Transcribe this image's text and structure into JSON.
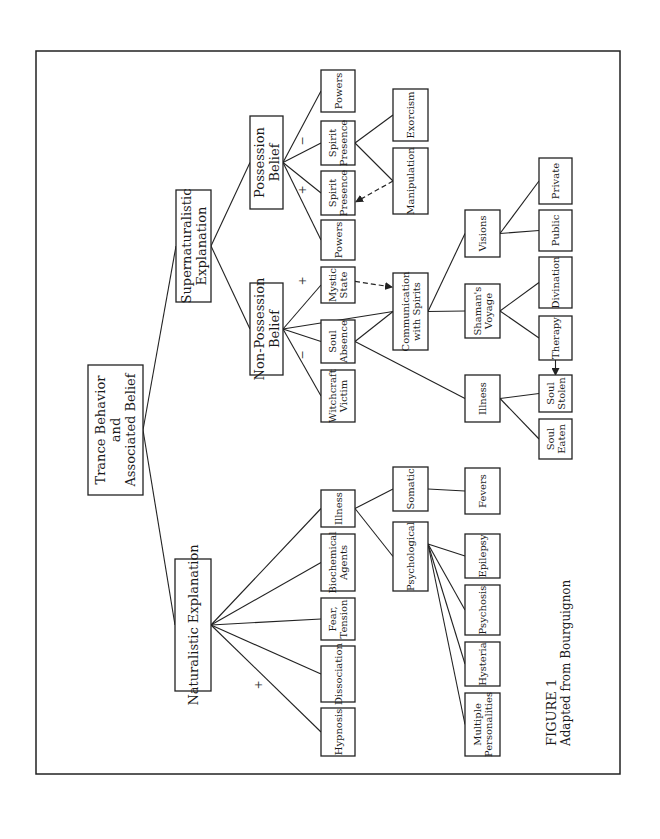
{
  "figure": {
    "caption_title": "FIGURE 1",
    "caption_subtitle": "Adapted from Bourguignon"
  },
  "nodes": {
    "root": {
      "lines": [
        "Trance Behavior",
        "and",
        "Associated Belief"
      ],
      "x": 88,
      "y": 365,
      "w": 55,
      "h": 130,
      "size": "large"
    },
    "supernaturalistic": {
      "lines": [
        "Supernaturalistic",
        "Explanation"
      ],
      "x": 176,
      "y": 190,
      "w": 35,
      "h": 112,
      "size": "large"
    },
    "naturalistic": {
      "lines": [
        "Naturalistic Explanation"
      ],
      "x": 175,
      "y": 559,
      "w": 36,
      "h": 132,
      "size": "large"
    },
    "possession": {
      "lines": [
        "Possession",
        "Belief"
      ],
      "x": 250,
      "y": 116,
      "w": 33,
      "h": 93,
      "size": "large"
    },
    "non_possession": {
      "lines": [
        "Non-Possession",
        "Belief"
      ],
      "x": 250,
      "y": 283,
      "w": 33,
      "h": 92,
      "size": "large"
    },
    "powers_neg": {
      "lines": [
        "Powers"
      ],
      "x": 321,
      "y": 70,
      "w": 34,
      "h": 42
    },
    "spirit_presence_neg": {
      "lines": [
        "Spirit",
        "Presence"
      ],
      "x": 321,
      "y": 121,
      "w": 34,
      "h": 44
    },
    "spirit_presence_pos": {
      "lines": [
        "Spirit",
        "Presence"
      ],
      "x": 321,
      "y": 171,
      "w": 34,
      "h": 44
    },
    "powers_pos": {
      "lines": [
        "Powers"
      ],
      "x": 321,
      "y": 220,
      "w": 34,
      "h": 40
    },
    "mystic_state": {
      "lines": [
        "Mystic",
        "State"
      ],
      "x": 321,
      "y": 267,
      "w": 34,
      "h": 36
    },
    "soul_absence": {
      "lines": [
        "Soul",
        "Absence"
      ],
      "x": 321,
      "y": 320,
      "w": 34,
      "h": 43
    },
    "witchcraft_victim": {
      "lines": [
        "Witchcraft",
        "Victim"
      ],
      "x": 321,
      "y": 370,
      "w": 34,
      "h": 52
    },
    "illness_nat": {
      "lines": [
        "Illness"
      ],
      "x": 321,
      "y": 490,
      "w": 34,
      "h": 37
    },
    "biochemical_agents": {
      "lines": [
        "Biochemical",
        "Agents"
      ],
      "x": 321,
      "y": 534,
      "w": 34,
      "h": 57
    },
    "fear_tension": {
      "lines": [
        "Fear,",
        "Tension"
      ],
      "x": 321,
      "y": 598,
      "w": 34,
      "h": 42
    },
    "dissociation": {
      "lines": [
        "Dissociation"
      ],
      "x": 321,
      "y": 646,
      "w": 34,
      "h": 56
    },
    "hypnosis": {
      "lines": [
        "Hypnosis"
      ],
      "x": 321,
      "y": 708,
      "w": 34,
      "h": 48
    },
    "exorcism": {
      "lines": [
        "Exorcism"
      ],
      "x": 393,
      "y": 89,
      "w": 35,
      "h": 52
    },
    "manipulation": {
      "lines": [
        "Manipulation"
      ],
      "x": 393,
      "y": 148,
      "w": 35,
      "h": 66
    },
    "communication": {
      "lines": [
        "Communication",
        "with Spirits"
      ],
      "x": 393,
      "y": 273,
      "w": 35,
      "h": 77
    },
    "somatic": {
      "lines": [
        "Somatic"
      ],
      "x": 393,
      "y": 467,
      "w": 35,
      "h": 44
    },
    "psychological": {
      "lines": [
        "Psychological"
      ],
      "x": 393,
      "y": 522,
      "w": 35,
      "h": 69
    },
    "visions": {
      "lines": [
        "Visions"
      ],
      "x": 465,
      "y": 210,
      "w": 35,
      "h": 47
    },
    "shamans_voyage": {
      "lines": [
        "Shaman's",
        "Voyage"
      ],
      "x": 465,
      "y": 284,
      "w": 35,
      "h": 54
    },
    "illness_super": {
      "lines": [
        "Illness"
      ],
      "x": 465,
      "y": 375,
      "w": 35,
      "h": 47
    },
    "fevers": {
      "lines": [
        "Fevers"
      ],
      "x": 465,
      "y": 468,
      "w": 35,
      "h": 46
    },
    "epilepsy": {
      "lines": [
        "Epilepsy"
      ],
      "x": 465,
      "y": 534,
      "w": 35,
      "h": 44
    },
    "psychosis": {
      "lines": [
        "Psychosis"
      ],
      "x": 465,
      "y": 585,
      "w": 35,
      "h": 50
    },
    "hysteria": {
      "lines": [
        "Hysteria"
      ],
      "x": 465,
      "y": 642,
      "w": 35,
      "h": 44
    },
    "multiple_personalities": {
      "lines": [
        "Multiple",
        "Personalities"
      ],
      "x": 465,
      "y": 693,
      "w": 35,
      "h": 63
    },
    "private": {
      "lines": [
        "Private"
      ],
      "x": 539,
      "y": 158,
      "w": 33,
      "h": 46
    },
    "public": {
      "lines": [
        "Public"
      ],
      "x": 539,
      "y": 210,
      "w": 33,
      "h": 41
    },
    "divination": {
      "lines": [
        "Divination"
      ],
      "x": 539,
      "y": 257,
      "w": 33,
      "h": 51
    },
    "therapy": {
      "lines": [
        "Therapy"
      ],
      "x": 539,
      "y": 316,
      "w": 33,
      "h": 44
    },
    "soul_stolen": {
      "lines": [
        "Soul",
        "Stolen"
      ],
      "x": 539,
      "y": 375,
      "w": 33,
      "h": 37
    },
    "soul_eaten": {
      "lines": [
        "Soul",
        "Eaten"
      ],
      "x": 539,
      "y": 419,
      "w": 33,
      "h": 40
    }
  },
  "edges": [
    {
      "from": "root",
      "to": "supernaturalistic",
      "style": "solid"
    },
    {
      "from": "root",
      "to": "naturalistic",
      "style": "solid"
    },
    {
      "from": "supernaturalistic",
      "to": "possession",
      "style": "solid"
    },
    {
      "from": "supernaturalistic",
      "to": "non_possession",
      "style": "solid"
    },
    {
      "from": "possession",
      "to": "powers_neg",
      "style": "solid"
    },
    {
      "from": "possession",
      "to": "spirit_presence_neg",
      "style": "solid"
    },
    {
      "from": "possession",
      "to": "spirit_presence_pos",
      "style": "solid"
    },
    {
      "from": "possession",
      "to": "powers_pos",
      "style": "solid"
    },
    {
      "from": "spirit_presence_neg",
      "to": "exorcism",
      "style": "solid"
    },
    {
      "from": "spirit_presence_neg",
      "to": "manipulation",
      "style": "solid"
    },
    {
      "from": "manipulation",
      "to": "spirit_presence_pos",
      "style": "dashed-arrow"
    },
    {
      "from": "non_possession",
      "to": "mystic_state",
      "style": "solid"
    },
    {
      "from": "non_possession",
      "to": "communication",
      "style": "solid"
    },
    {
      "from": "non_possession",
      "to": "soul_absence",
      "style": "solid"
    },
    {
      "from": "non_possession",
      "to": "witchcraft_victim",
      "style": "solid"
    },
    {
      "from": "mystic_state",
      "to": "communication",
      "style": "dashed-arrow"
    },
    {
      "from": "soul_absence",
      "to": "communication",
      "style": "solid"
    },
    {
      "from": "soul_absence",
      "to": "illness_super",
      "style": "solid"
    },
    {
      "from": "communication",
      "to": "visions",
      "style": "solid"
    },
    {
      "from": "communication",
      "to": "shamans_voyage",
      "style": "solid"
    },
    {
      "from": "visions",
      "to": "private",
      "style": "solid"
    },
    {
      "from": "visions",
      "to": "public",
      "style": "solid"
    },
    {
      "from": "shamans_voyage",
      "to": "divination",
      "style": "solid"
    },
    {
      "from": "shamans_voyage",
      "to": "therapy",
      "style": "solid"
    },
    {
      "from": "therapy",
      "to": "soul_stolen",
      "style": "arrow"
    },
    {
      "from": "illness_super",
      "to": "soul_stolen",
      "style": "solid"
    },
    {
      "from": "illness_super",
      "to": "soul_eaten",
      "style": "solid"
    },
    {
      "from": "naturalistic",
      "to": "illness_nat",
      "style": "solid"
    },
    {
      "from": "naturalistic",
      "to": "biochemical_agents",
      "style": "solid"
    },
    {
      "from": "naturalistic",
      "to": "fear_tension",
      "style": "solid"
    },
    {
      "from": "naturalistic",
      "to": "dissociation",
      "style": "solid"
    },
    {
      "from": "naturalistic",
      "to": "hypnosis",
      "style": "solid"
    },
    {
      "from": "illness_nat",
      "to": "somatic",
      "style": "solid"
    },
    {
      "from": "illness_nat",
      "to": "psychological",
      "style": "solid"
    },
    {
      "from": "somatic",
      "to": "fevers",
      "style": "solid"
    },
    {
      "from": "psychological",
      "to": "epilepsy",
      "style": "solid"
    },
    {
      "from": "psychological",
      "to": "psychosis",
      "style": "solid"
    },
    {
      "from": "psychological",
      "to": "hysteria",
      "style": "solid"
    },
    {
      "from": "psychological",
      "to": "multiple_personalities",
      "style": "solid"
    }
  ],
  "signs": [
    {
      "text": "−",
      "x": 306,
      "y": 141
    },
    {
      "text": "+",
      "x": 306,
      "y": 190
    },
    {
      "text": "+",
      "x": 306,
      "y": 281
    },
    {
      "text": "−",
      "x": 306,
      "y": 355
    },
    {
      "text": "+",
      "x": 262,
      "y": 685
    }
  ]
}
